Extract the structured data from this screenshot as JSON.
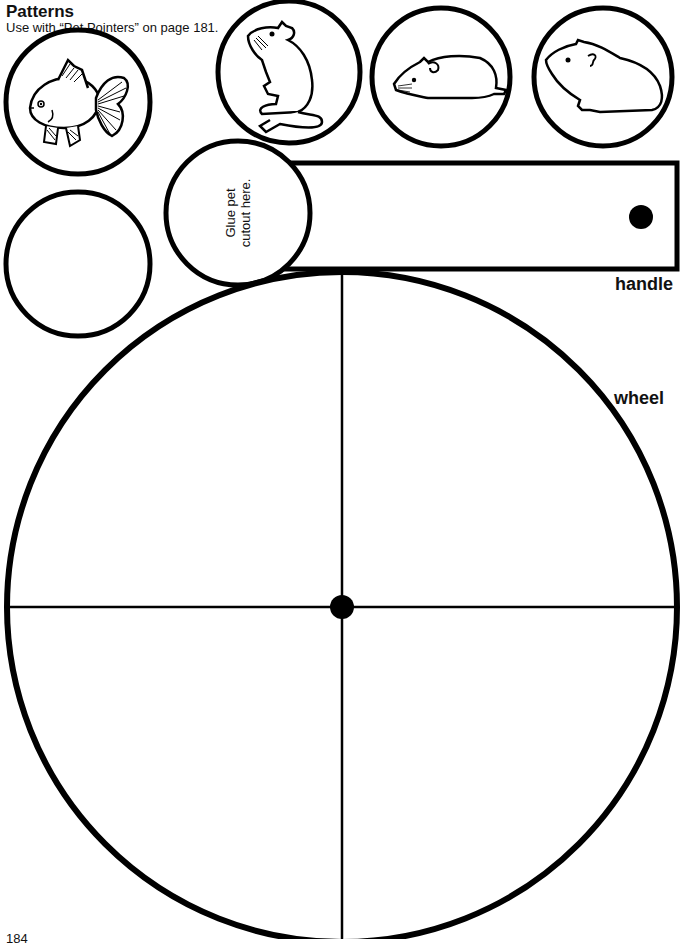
{
  "header": {
    "title": "Patterns",
    "subtitle": "Use with “Pet Pointers” on page 181."
  },
  "pet_cutouts": [
    {
      "name": "goldfish",
      "icon": "goldfish-icon"
    },
    {
      "name": "gerbil",
      "icon": "gerbil-icon"
    },
    {
      "name": "hamster",
      "icon": "hamster-icon"
    },
    {
      "name": "guinea-pig",
      "icon": "guinea-pig-icon"
    },
    {
      "name": "blank",
      "icon": "blank-circle"
    }
  ],
  "handle": {
    "glue_text_line1": "Glue pet",
    "glue_text_line2": "cutout here.",
    "label": "handle"
  },
  "wheel": {
    "label": "wheel",
    "sections": 4
  },
  "footer": {
    "page_number": "184"
  },
  "colors": {
    "ink": "#000000",
    "paper": "#ffffff"
  }
}
